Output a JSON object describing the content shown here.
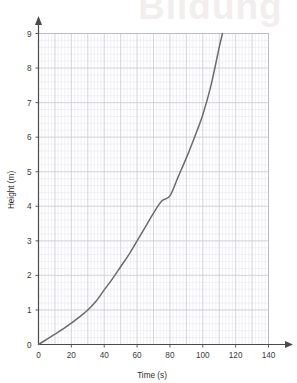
{
  "watermark": {
    "text": "Bildung"
  },
  "chart_data": {
    "type": "line",
    "title": "",
    "xlabel": "Time (s)",
    "ylabel": "Height (m)",
    "xlim": [
      0,
      140
    ],
    "ylim": [
      0,
      9
    ],
    "xticks": [
      0,
      20,
      40,
      60,
      80,
      100,
      120,
      140
    ],
    "yticks": [
      0,
      1,
      2,
      3,
      4,
      5,
      6,
      7,
      8,
      9
    ],
    "xtick_labels": [
      "0",
      "20",
      "40",
      "60",
      "80",
      "100",
      "120",
      "140"
    ],
    "ytick_labels": [
      "0",
      "1",
      "2",
      "3",
      "4",
      "5",
      "6",
      "7",
      "8",
      "9"
    ],
    "grid": true,
    "grid_major_step_x": 10,
    "grid_major_step_y": 1,
    "grid_minor_step_x": 2,
    "grid_minor_step_y": 0.2,
    "legend": null,
    "legend_position": "none",
    "series": [
      {
        "name": "Height vs Time",
        "color": "#6b6b6b",
        "x": [
          0,
          5,
          10,
          15,
          20,
          25,
          30,
          35,
          40,
          45,
          50,
          55,
          60,
          65,
          70,
          75,
          80,
          85,
          90,
          95,
          100,
          105,
          110,
          112
        ],
        "y": [
          0.0,
          0.15,
          0.3,
          0.45,
          0.62,
          0.8,
          1.0,
          1.25,
          1.58,
          1.9,
          2.25,
          2.6,
          3.0,
          3.4,
          3.8,
          4.15,
          4.3,
          4.85,
          5.4,
          6.0,
          6.65,
          7.5,
          8.6,
          9.0
        ]
      }
    ],
    "axis_arrows": true,
    "axis_color": "#4a4a4a",
    "grid_major_color": "#c9c9d4",
    "grid_minor_color": "#e8e8ef",
    "plot_border_color": "#b9b9c6"
  }
}
